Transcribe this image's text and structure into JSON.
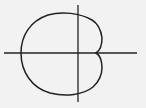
{
  "diagram": {
    "type": "polar-curve",
    "background": "#f2f2f2",
    "stroke": "#222222",
    "axes": {
      "horizontal": true,
      "vertical": true
    }
  }
}
